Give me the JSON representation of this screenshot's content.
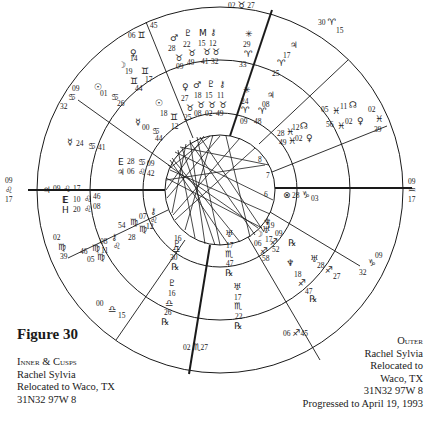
{
  "figure": {
    "title": "Figure 30"
  },
  "caption_inner": {
    "heading": "Inner & Cusps",
    "lines": [
      "Rachel Sylvia",
      "Relocated to Waco, TX",
      "31N32 97W 8"
    ]
  },
  "caption_outer": {
    "heading": "Outer",
    "lines": [
      "Rachel Sylvia",
      "Relocated to",
      "Waco, TX",
      "31N32 97W 8",
      "Progressed to April 19, 1993"
    ]
  },
  "chart": {
    "center": [
      220,
      190
    ],
    "radii": {
      "outer": 183,
      "middle": 130,
      "inner": 77,
      "core": 55
    },
    "line_color": "#1a1a1a",
    "cusps": [
      {
        "house": 10,
        "label": "02 ♉ 27",
        "x": 215,
        "y": 16
      },
      {
        "house": 11,
        "label": "30 ♈ 15",
        "x": 318,
        "y": 48
      },
      {
        "house": 12,
        "label": "02 ♓ 39",
        "x": 375,
        "y": 108
      },
      {
        "house": 1,
        "label": "09 ♒ 17",
        "x": 424,
        "y": 188
      },
      {
        "house": 2,
        "label": "09 ♑ 32",
        "x": 372,
        "y": 262
      },
      {
        "house": 3,
        "label": "06 ♐ 45",
        "x": 290,
        "y": 340
      },
      {
        "house": 4,
        "label": "02 ♏ 27",
        "x": 195,
        "y": 350
      },
      {
        "house": 5,
        "label": "00 ♎ 15",
        "x": 100,
        "y": 310
      },
      {
        "house": 6,
        "label": "02 ♍ 39",
        "x": 58,
        "y": 240
      },
      {
        "house": 7,
        "label": "09 ♌ 17",
        "x": 5,
        "y": 190
      },
      {
        "house": 8,
        "label": "09 ♋ 32",
        "x": 68,
        "y": 98
      },
      {
        "house": 9,
        "label": "06 ♊ 45",
        "x": 130,
        "y": 30
      }
    ],
    "outer_planets": [
      {
        "glyph": "♂",
        "deg": "28",
        "sign": "♉",
        "min": "09"
      },
      {
        "glyph": "♇",
        "deg": "22",
        "sign": "♉",
        "min": "49"
      },
      {
        "glyph": "M",
        "deg": "15",
        "sign": "♉",
        "min": "41"
      },
      {
        "glyph": "⚷",
        "deg": "12",
        "sign": "♉",
        "min": "32"
      },
      {
        "glyph": "✳",
        "deg": "29",
        "sign": "♈",
        "min": "33"
      },
      {
        "glyph": "♃",
        "deg": "17",
        "sign": "♈",
        "min": "25"
      },
      {
        "glyph": "☊",
        "deg": "11",
        "sign": "♓",
        "min": "05"
      },
      {
        "glyph": "♀",
        "deg": "02",
        "sign": "♓",
        "min": "56"
      },
      {
        "glyph": "☽",
        "deg": "14",
        "sign": "♊",
        "min": "17"
      },
      {
        "glyph": "♀",
        "deg": "19",
        "sign": "♊",
        "min": "44"
      },
      {
        "glyph": "☉",
        "deg": "01",
        "sign": "♋",
        "min": "26"
      },
      {
        "glyph": "☿",
        "deg": "24",
        "sign": "♋",
        "min": "41"
      },
      {
        "glyph": "♃",
        "deg": "09",
        "sign": "♌",
        "min": "17"
      },
      {
        "glyph": "E",
        "deg": "10",
        "sign": "♌",
        "min": "46"
      },
      {
        "glyph": "H",
        "deg": "20",
        "sign": "♌",
        "min": "08"
      },
      {
        "glyph": "⚷",
        "deg": "08",
        "sign": "♍",
        "min": "11"
      },
      {
        "glyph": "♇",
        "deg": "46",
        "sign": "♍",
        "min": "05"
      },
      {
        "glyph": "♆",
        "deg": "00",
        "sign": "♎",
        "min": "15"
      },
      {
        "glyph": "♇",
        "deg": "16",
        "sign": "♎",
        "min": "26",
        "retro": "℞"
      },
      {
        "glyph": "♅",
        "deg": "17",
        "sign": "♏",
        "min": "22",
        "retro": "℞"
      },
      {
        "glyph": "♆",
        "deg": "18",
        "sign": "♐",
        "min": "47",
        "retro": "℞"
      },
      {
        "glyph": "♅",
        "deg": "28",
        "sign": "♐",
        "min": "27"
      },
      {
        "glyph": "⊗",
        "deg": "28",
        "sign": "♑",
        "min": "03"
      }
    ],
    "inner_planets": [
      {
        "glyph": "♀",
        "deg": "27",
        "sign": "♉",
        "min": "25"
      },
      {
        "glyph": "♂",
        "deg": "18",
        "sign": "♉",
        "min": "08"
      },
      {
        "glyph": "♇",
        "deg": "15",
        "sign": "♉",
        "min": "02"
      },
      {
        "glyph": "⚷",
        "deg": "11",
        "sign": "♉",
        "min": "49"
      },
      {
        "glyph": "✳",
        "deg": "24",
        "sign": "♈",
        "min": "09"
      },
      {
        "glyph": "♃",
        "deg": "08",
        "sign": "♈",
        "min": "48"
      },
      {
        "glyph": "☊",
        "deg": "12",
        "sign": "♓",
        "min": "28"
      },
      {
        "glyph": "♀",
        "deg": "02",
        "sign": "♓",
        "min": "49"
      },
      {
        "glyph": "☉",
        "deg": "18",
        "sign": "♊",
        "min": "12"
      },
      {
        "glyph": "☿",
        "deg": "00",
        "sign": "♋",
        "min": "44"
      },
      {
        "glyph": "E",
        "deg": "28",
        "sign": "♋",
        "min": "09"
      },
      {
        "glyph": "♃",
        "deg": "06",
        "sign": "♌",
        "min": "42"
      },
      {
        "glyph": "⚷",
        "deg": "07",
        "sign": "♍",
        "min": "54"
      },
      {
        "glyph": "♇",
        "deg": "12",
        "sign": "♍",
        "min": "28"
      },
      {
        "glyph": "♇",
        "deg": "16",
        "sign": "♎",
        "min": "30",
        "retro": "℞"
      },
      {
        "glyph": "♅",
        "deg": "17",
        "sign": "♏",
        "min": "47",
        "retro": "℞"
      },
      {
        "glyph": "☽",
        "deg": "17",
        "sign": "♐",
        "min": "06"
      },
      {
        "glyph": "♅",
        "deg": "09",
        "sign": "♐",
        "min": "52",
        "retro": "℞"
      },
      {
        "glyph": "♆",
        "deg": "19",
        "sign": "♐",
        "min": "58"
      }
    ]
  }
}
